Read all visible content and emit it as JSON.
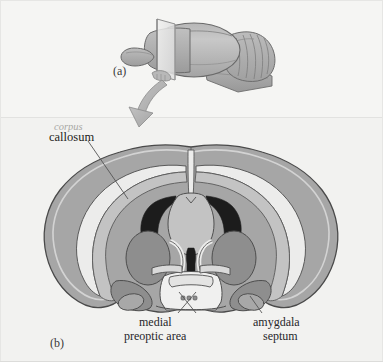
{
  "figure": {
    "background_color": "#f3f3f1",
    "panels": [
      {
        "id": "a",
        "label": "(a)",
        "description": "lateral view of rodent brain with coronal cutting plane"
      },
      {
        "id": "b",
        "label": "(b)",
        "description": "coronal section through the forebrain"
      }
    ]
  },
  "labels": {
    "panel_a": "(a)",
    "panel_b": "(b)",
    "corpus": "corpus",
    "callosum": "callosum",
    "medial": "medial",
    "preoptic_area": "preoptic area",
    "amygdala": "amygdala",
    "septum": "septum"
  },
  "colors": {
    "background": "#f3f3f1",
    "cortex_gray": "#a6a6a6",
    "inner_light": "#c3c3c3",
    "white_matter": "#ececeb",
    "ventricle_dark": "#1c1c1c",
    "nucleus_mid": "#8e8e8e",
    "outline": "#4a4a4a",
    "brain_top": "#b4b4b4",
    "brain_shade": "#9a9a9a",
    "arrow_fill": "#b2b2b2",
    "text_dark": "#1d1d20",
    "text_faded": "#a9a9a6"
  },
  "structures": [
    {
      "name": "corpus callosum",
      "panel": "b",
      "shade": "white_matter"
    },
    {
      "name": "lateral ventricle",
      "panel": "b",
      "shade": "ventricle_dark"
    },
    {
      "name": "third ventricle",
      "panel": "b",
      "shade": "ventricle_dark"
    },
    {
      "name": "caudate putamen",
      "panel": "b",
      "shade": "nucleus_mid"
    },
    {
      "name": "medial preoptic area",
      "panel": "b",
      "shade": "inner_light"
    },
    {
      "name": "amygdala",
      "panel": "b",
      "shade": "nucleus_mid"
    },
    {
      "name": "septum",
      "panel": "b",
      "shade": "inner_light"
    },
    {
      "name": "cerebral cortex",
      "panel": "b",
      "shade": "cortex_gray"
    },
    {
      "name": "olfactory bulb",
      "panel": "a",
      "shade": "brain_shade"
    },
    {
      "name": "cerebral hemisphere",
      "panel": "a",
      "shade": "brain_top"
    },
    {
      "name": "cerebellum",
      "panel": "a",
      "shade": "brain_shade"
    },
    {
      "name": "brainstem",
      "panel": "a",
      "shade": "brain_shade"
    },
    {
      "name": "cutting plane",
      "panel": "a",
      "shade": "white_matter"
    }
  ]
}
